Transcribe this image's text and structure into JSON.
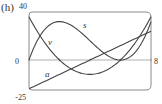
{
  "panel_label": "(h)",
  "colors": {
    "frame": "#8a8a8a",
    "axis": "#9a9a9a",
    "curve": "#444444",
    "text": "#333333"
  },
  "chart_data": {
    "type": "line",
    "title": "(h)",
    "xlabel": "",
    "ylabel": "",
    "xlim": [
      0,
      8
    ],
    "ylim": [
      -25,
      40
    ],
    "grid": false,
    "tick_labels": {
      "y_top": "40",
      "y_zero": "0",
      "y_bottom": "-25",
      "x_right": "8"
    },
    "x_ticks": [
      0,
      2,
      4,
      6,
      8
    ],
    "series": [
      {
        "name": "s",
        "label": "s",
        "x": [
          0,
          1,
          2,
          3,
          4,
          5,
          6,
          7,
          8
        ],
        "values": [
          0,
          25,
          32,
          27,
          16,
          5,
          0,
          7,
          32
        ]
      },
      {
        "name": "v",
        "label": "v",
        "x": [
          0,
          1,
          2,
          3,
          4,
          5,
          6,
          7,
          8
        ],
        "values": [
          36,
          15,
          0,
          -9,
          -12,
          -9,
          0,
          15,
          36
        ]
      },
      {
        "name": "a",
        "label": "a",
        "x": [
          0,
          1,
          2,
          3,
          4,
          5,
          6,
          7,
          8
        ],
        "values": [
          -24,
          -18,
          -12,
          -6,
          0,
          6,
          12,
          18,
          24
        ]
      }
    ]
  }
}
